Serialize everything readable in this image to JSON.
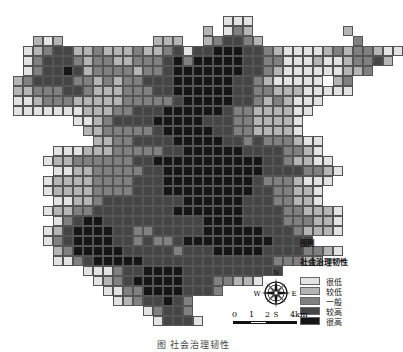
{
  "map": {
    "grid": {
      "origin_x": 3,
      "origin_y": 6,
      "cell_size": 10,
      "note": "approximate per-cell shading reconstructed by eye; overall spatial pattern only, not measured cell-level values",
      "rows": [
        "......................................",
        "......................111.............",
        "....................2.132.........2...",
        "...212.........222..234432.........3..",
        "..12344223222322341445554432111123233211",
        "..1344432332233345355555443311121123342",
        "..13445423333233455555554432111111223",
        ".2344443323233444555555443211111.23",
        ".2233344322233344555555443322211111",
        ".1123332222233333455555443232111",
        ".111111122233444555555433222211",
        ".......11234444555554443322221",
        "........2233333455555443322221",
        ".........22334444555554434333211",
        ".....111222333334455555544443321",
        "....12233333344555555555554432211",
        ".....11223333344555555555544443321",
        "....12222333344455555555543332111",
        "....1222233334445555555554433221",
        ".....112234444444455555544433221",
        "....122334444444455555554444332221",
        ".....13455444444444455554444333221",
        "....124555544334444455555544432221",
        "....134555544343345555555554444",
        ".....23555554444434445555544443321",
        ".....113455555444444444444433322",
        "........11134455554444444444",
        ".........12345555544433221",
        "..........113355554443",
        "...........12344543",
        "..............13443",
        "...............14441"
      ]
    },
    "colors": {
      "level_1": "#e3e3e3",
      "level_2": "#b4b4b4",
      "level_3": "#808080",
      "level_4": "#454545",
      "level_5": "#151515",
      "grid_line": "#555555"
    }
  },
  "legend": {
    "title": "图例",
    "subtitle": "社会治理韧性",
    "items": [
      {
        "label": "很低",
        "color": "#e3e3e3"
      },
      {
        "label": "较低",
        "color": "#b4b4b4"
      },
      {
        "label": "一般",
        "color": "#808080"
      },
      {
        "label": "较高",
        "color": "#454545"
      },
      {
        "label": "很高",
        "color": "#151515"
      }
    ]
  },
  "compass": {
    "n": "N",
    "s": "S",
    "e": "E",
    "w": "W"
  },
  "scalebar": {
    "ticks": [
      "0",
      "1",
      "2",
      "4km"
    ]
  },
  "caption": "图 社会治理韧性"
}
